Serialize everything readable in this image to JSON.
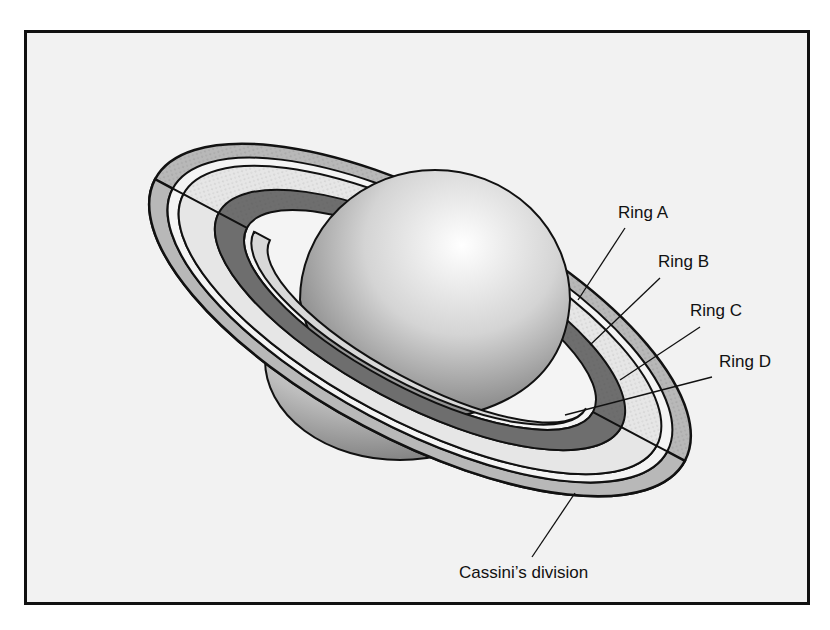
{
  "diagram": {
    "labels": {
      "ring_a": "Ring A",
      "ring_b": "Ring B",
      "ring_c": "Ring C",
      "ring_d": "Ring D",
      "cassini": "Cassini’s division"
    },
    "colors": {
      "background": "#f2f2f2",
      "frame": "#111111",
      "ring_a_fill": "#b8b8b8",
      "ring_b_fill": "#e6e6e6",
      "ring_c_fill": "#6e6e6e",
      "ring_d_fill": "#d8d8d8"
    }
  }
}
